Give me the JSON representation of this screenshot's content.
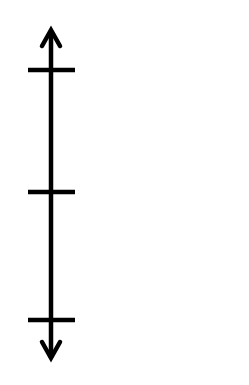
{
  "diagram": {
    "type": "vertical-number-line",
    "orientation": "vertical",
    "stroke_color": "#000000",
    "background_color": "#ffffff",
    "arrows": [
      "top",
      "bottom"
    ],
    "tick_count": 3,
    "tick_labels": []
  }
}
